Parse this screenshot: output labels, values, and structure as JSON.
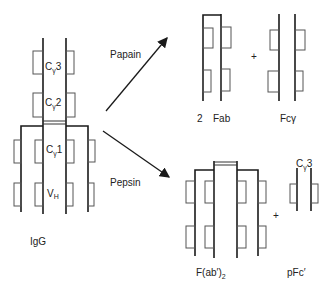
{
  "igg": {
    "label": "IgG",
    "domains": [
      {
        "base": "C",
        "sub": "γ",
        "num": "3"
      },
      {
        "base": "C",
        "sub": "γ",
        "num": "2"
      },
      {
        "base": "C",
        "sub": "γ",
        "num": "1"
      },
      {
        "base": "V",
        "sub": "H",
        "num": ""
      }
    ]
  },
  "enzymes": {
    "papain": "Papain",
    "pepsin": "Pepsin"
  },
  "papain_products": {
    "fab_count": "2",
    "fab_label": "Fab",
    "plus": "+",
    "fc_label": "Fcγ"
  },
  "pepsin_products": {
    "fab2_label": "F(ab′)",
    "fab2_sub": "2",
    "plus": "+",
    "pfc_label": "pFc′",
    "pfc_domain": {
      "base": "C",
      "sub": "γ",
      "num": "3"
    }
  }
}
